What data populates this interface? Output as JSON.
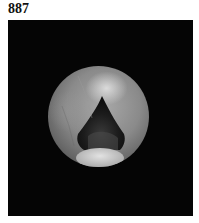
{
  "figure": {
    "label": "887",
    "colors": {
      "background": "#ffffff",
      "frame": "#050505",
      "tissue_light": "#d8d8d8",
      "tissue_mid": "#8a8a8a",
      "opening_dark": "#141414",
      "lower_bright": "#d0d0d0"
    }
  }
}
